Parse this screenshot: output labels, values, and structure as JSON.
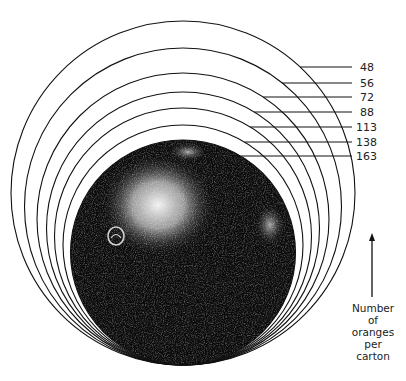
{
  "diagram": {
    "sizes": [
      {
        "label": "48",
        "count": 48
      },
      {
        "label": "56",
        "count": 56
      },
      {
        "label": "72",
        "count": 72
      },
      {
        "label": "88",
        "count": 88
      },
      {
        "label": "113",
        "count": 113
      },
      {
        "label": "138",
        "count": 138
      },
      {
        "label": "163",
        "count": 163
      }
    ],
    "axis_caption": [
      "Number",
      "of",
      "oranges",
      "per",
      "carton"
    ],
    "colors": {
      "ink": "#111111",
      "orange_dark": "#0b0b0b",
      "highlight": "#e8e8e8",
      "background": "#ffffff"
    }
  }
}
